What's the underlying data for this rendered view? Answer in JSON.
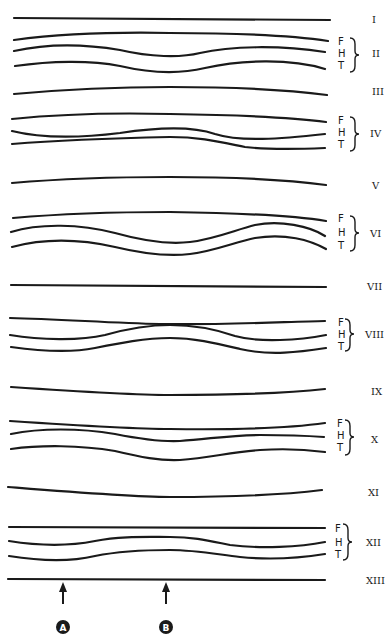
{
  "diagram": {
    "type": "stacked waveform schematic",
    "line_color": "#1a1a1a",
    "background": "#ffffff",
    "layer_labels": [
      "F",
      "H",
      "T"
    ],
    "rows": [
      {
        "label": "I",
        "kind": "single",
        "shape": "straight"
      },
      {
        "label": "II",
        "kind": "triple",
        "labels": [
          "F",
          "H",
          "T"
        ],
        "shape": "H and T dip in center"
      },
      {
        "label": "III",
        "kind": "single",
        "shape": "slight arch"
      },
      {
        "label": "IV",
        "kind": "triple",
        "labels": [
          "F",
          "H",
          "T"
        ],
        "shape": "H and T rise toward center, converge"
      },
      {
        "label": "V",
        "kind": "single",
        "shape": "slight arch"
      },
      {
        "label": "VI",
        "kind": "triple",
        "labels": [
          "F",
          "H",
          "T"
        ],
        "shape": "H and T deep dip in center"
      },
      {
        "label": "VII",
        "kind": "single",
        "shape": "straight"
      },
      {
        "label": "VIII",
        "kind": "triple",
        "labels": [
          "F",
          "H",
          "T"
        ],
        "shape": "F dips slightly, H and T bulge up in center"
      },
      {
        "label": "IX",
        "kind": "single",
        "shape": "slight sag"
      },
      {
        "label": "X",
        "kind": "triple",
        "labels": [
          "F",
          "H",
          "T"
        ],
        "shape": "F sags, H and T dip in center"
      },
      {
        "label": "XI",
        "kind": "single",
        "shape": "slight sag"
      },
      {
        "label": "XII",
        "kind": "triple",
        "labels": [
          "F",
          "H",
          "T"
        ],
        "shape": "H and T rise in center"
      },
      {
        "label": "XIII",
        "kind": "single",
        "shape": "straight"
      }
    ],
    "markers": [
      {
        "letter": "A",
        "x": 63
      },
      {
        "letter": "B",
        "x": 166
      }
    ]
  },
  "labels": {
    "I": "I",
    "II": "II",
    "III": "III",
    "IV": "IV",
    "V": "V",
    "VI": "VI",
    "VII": "VII",
    "VIII": "VIII",
    "IX": "IX",
    "X": "X",
    "XI": "XI",
    "XII": "XII",
    "XIII": "XIII",
    "F": "F",
    "H": "H",
    "T": "T",
    "A": "A",
    "B": "B"
  }
}
